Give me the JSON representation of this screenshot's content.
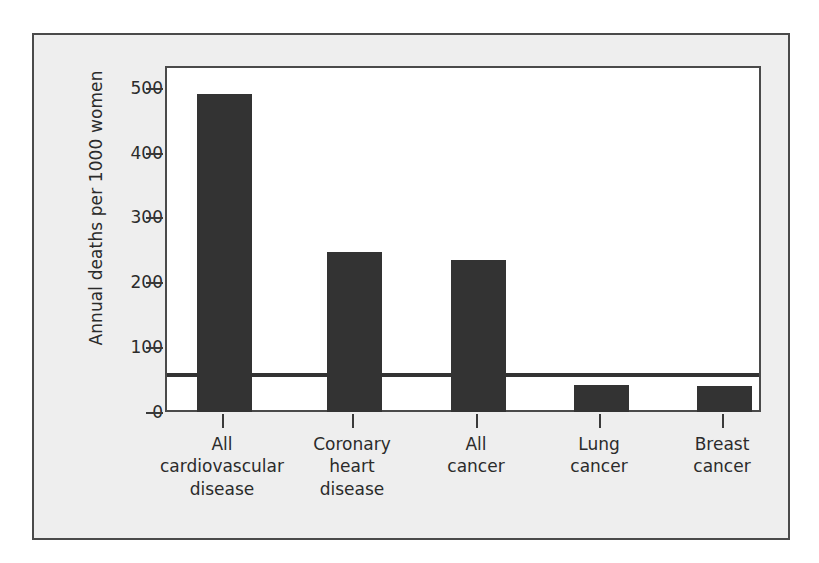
{
  "chart_data": {
    "type": "bar",
    "title": "",
    "subtitle": "",
    "xlabel": "",
    "ylabel": "Annual deaths per 1000 women",
    "categories": [
      "All\ncardiovascular\ndisease",
      "Coronary\nheart\ndisease",
      "All\ncancer",
      "Lung\ncancer",
      "Breast\ncancer"
    ],
    "category_lines": [
      [
        "All",
        "cardiovascular",
        "disease"
      ],
      [
        "Coronary",
        "heart",
        "disease"
      ],
      [
        "All",
        "cancer"
      ],
      [
        "Lung",
        "cancer"
      ],
      [
        "Breast",
        "cancer"
      ]
    ],
    "values": [
      490,
      247,
      234,
      41,
      40
    ],
    "ylim": [
      0,
      530
    ],
    "yticks": [
      0,
      100,
      200,
      300,
      400,
      500
    ],
    "ytick_labels": [
      "0",
      "100",
      "200",
      "300",
      "400",
      "500"
    ],
    "grid": false,
    "legend": null,
    "bar_color": "#333333",
    "plot_background": "#ffffff",
    "panel_background": "#eeeeee",
    "frame_color": "#4a4a4a",
    "text_color": "#2b2b2b"
  }
}
